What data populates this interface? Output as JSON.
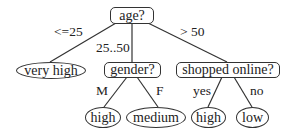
{
  "tree": {
    "root": {
      "label": "age?"
    },
    "branches": {
      "age_le25": "<=25",
      "age_25_50": "25..50",
      "age_gt50": "> 50",
      "gender_m": "M",
      "gender_f": "F",
      "shopped_yes": "yes",
      "shopped_no": "no"
    },
    "nodes": {
      "very_high": "very high",
      "gender": "gender?",
      "shopped_online": "shopped online?",
      "gender_m_leaf": "high",
      "gender_f_leaf": "medium",
      "shopped_yes_leaf": "high",
      "shopped_no_leaf": "low"
    }
  }
}
